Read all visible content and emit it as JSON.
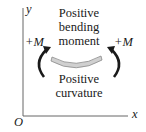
{
  "diagram": {
    "axis_y_label": "y",
    "axis_x_label": "x",
    "origin_label": "O",
    "top_text": [
      "Positive",
      "bending",
      "moment"
    ],
    "bottom_text": [
      "Positive",
      "curvature"
    ],
    "moment_left": "+M",
    "moment_right": "+M",
    "colors": {
      "beam_fill": "#d0d0d0",
      "beam_stroke": "#8a8a8a",
      "arrow": "#1a1a1a",
      "axis": "#555555"
    }
  }
}
